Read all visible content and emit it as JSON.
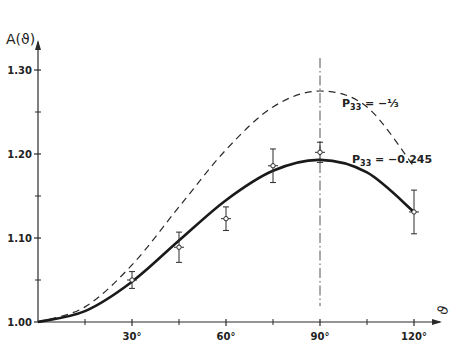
{
  "chart_data": {
    "type": "line",
    "title": "",
    "xlabel": "ϑ",
    "ylabel": "A(ϑ)",
    "xlim": [
      0,
      120
    ],
    "ylim": [
      1.0,
      1.3
    ],
    "x_ticks": [
      {
        "value": 30,
        "label": "30°"
      },
      {
        "value": 60,
        "label": "60°"
      },
      {
        "value": 90,
        "label": "90°"
      },
      {
        "value": 120,
        "label": "120°"
      }
    ],
    "x_minor_ticks": [
      15,
      45,
      75,
      105
    ],
    "y_ticks": [
      {
        "value": 1.0,
        "label": "1.00"
      },
      {
        "value": 1.1,
        "label": "1.10"
      },
      {
        "value": 1.2,
        "label": "1.20"
      },
      {
        "value": 1.3,
        "label": "1.30"
      }
    ],
    "y_minor_ticks": [
      1.05,
      1.15,
      1.25
    ],
    "grid": false,
    "vertical_reference_line": {
      "x": 90,
      "style": "dash-dot"
    },
    "series": [
      {
        "name": "P33 = -1/3",
        "label": "P₃₃ = −⅓",
        "style": "dashed",
        "x": [
          0,
          15,
          30,
          45,
          60,
          75,
          90,
          105,
          120
        ],
        "y": [
          1.0,
          1.018,
          1.068,
          1.137,
          1.205,
          1.256,
          1.275,
          1.256,
          1.185
        ]
      },
      {
        "name": "P33 = -0.245",
        "label": "P₃₃ = −0.245",
        "style": "solid",
        "x": [
          0,
          15,
          30,
          45,
          60,
          75,
          90,
          105,
          120
        ],
        "y": [
          1.0,
          1.013,
          1.048,
          1.097,
          1.145,
          1.18,
          1.193,
          1.178,
          1.131
        ]
      },
      {
        "name": "measured",
        "style": "points-with-error-bars",
        "x": [
          30,
          45,
          60,
          75,
          90,
          120
        ],
        "y": [
          1.05,
          1.089,
          1.123,
          1.186,
          1.202,
          1.131
        ],
        "yerr": [
          0.01,
          0.018,
          0.014,
          0.02,
          0.012,
          0.026
        ]
      }
    ]
  }
}
